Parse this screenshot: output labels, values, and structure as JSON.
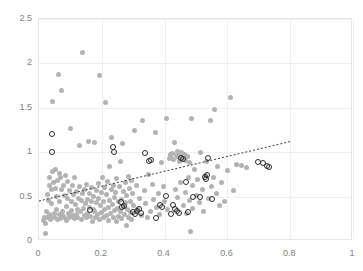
{
  "chart_data": {
    "type": "scatter",
    "title": "",
    "subtitle": "",
    "xlabel": "",
    "ylabel": "",
    "xlim": [
      0,
      1
    ],
    "ylim": [
      0,
      2.5
    ],
    "xticks": [
      "0",
      "0.2",
      "0.4",
      "0.6",
      "0.8",
      "1"
    ],
    "xtick_values": [
      0,
      0.2,
      0.4,
      0.6,
      0.8,
      1
    ],
    "yticks": [
      "0",
      "0.5",
      "1",
      "1.5",
      "2",
      "2.5"
    ],
    "ytick_values": [
      0,
      0.5,
      1,
      1.5,
      2,
      2.5
    ],
    "grid": true,
    "grid_color": "#f0f0f0",
    "legend": null,
    "legend_position": "none",
    "annotations": [],
    "series": [
      {
        "name": "gray-filled-points",
        "marker": "filled-circle",
        "color": "#b3b3b3",
        "points": [
          [
            0.015,
            0.23
          ],
          [
            0.018,
            0.27
          ],
          [
            0.02,
            0.2
          ],
          [
            0.022,
            0.08
          ],
          [
            0.024,
            0.33
          ],
          [
            0.026,
            0.26
          ],
          [
            0.028,
            0.52
          ],
          [
            0.03,
            0.46
          ],
          [
            0.032,
            0.62
          ],
          [
            0.034,
            0.3
          ],
          [
            0.035,
            0.71
          ],
          [
            0.036,
            0.28
          ],
          [
            0.038,
            0.24
          ],
          [
            0.04,
            0.58
          ],
          [
            0.041,
            0.42
          ],
          [
            0.043,
            0.78
          ],
          [
            0.044,
            1.57
          ],
          [
            0.046,
            0.66
          ],
          [
            0.048,
            0.31
          ],
          [
            0.05,
            0.27
          ],
          [
            0.052,
            0.8
          ],
          [
            0.054,
            0.59
          ],
          [
            0.055,
            0.5
          ],
          [
            0.057,
            0.36
          ],
          [
            0.058,
            0.24
          ],
          [
            0.06,
            0.68
          ],
          [
            0.062,
            1.88
          ],
          [
            0.064,
            0.76
          ],
          [
            0.065,
            0.44
          ],
          [
            0.066,
            0.3
          ],
          [
            0.068,
            0.25
          ],
          [
            0.07,
            0.72
          ],
          [
            0.072,
            0.58
          ],
          [
            0.073,
            1.7
          ],
          [
            0.075,
            0.33
          ],
          [
            0.076,
            0.29
          ],
          [
            0.078,
            0.62
          ],
          [
            0.08,
            0.51
          ],
          [
            0.082,
            0.27
          ],
          [
            0.084,
            0.74
          ],
          [
            0.086,
            0.39
          ],
          [
            0.088,
            0.23
          ],
          [
            0.09,
            0.67
          ],
          [
            0.092,
            0.48
          ],
          [
            0.094,
            0.31
          ],
          [
            0.096,
            0.26
          ],
          [
            0.098,
            0.57
          ],
          [
            0.1,
            1.27
          ],
          [
            0.102,
            0.44
          ],
          [
            0.104,
            0.34
          ],
          [
            0.106,
            0.29
          ],
          [
            0.108,
            0.63
          ],
          [
            0.11,
            0.52
          ],
          [
            0.112,
            0.25
          ],
          [
            0.114,
            0.71
          ],
          [
            0.116,
            0.41
          ],
          [
            0.118,
            0.3
          ],
          [
            0.12,
            0.56
          ],
          [
            0.122,
            0.35
          ],
          [
            0.124,
            0.27
          ],
          [
            0.126,
            0.48
          ],
          [
            0.128,
            1.08
          ],
          [
            0.13,
            0.61
          ],
          [
            0.132,
            0.33
          ],
          [
            0.134,
            0.24
          ],
          [
            0.136,
            0.46
          ],
          [
            0.138,
            0.53
          ],
          [
            0.14,
            2.12
          ],
          [
            0.142,
            0.37
          ],
          [
            0.144,
            0.29
          ],
          [
            0.146,
            0.58
          ],
          [
            0.148,
            0.42
          ],
          [
            0.15,
            0.26
          ],
          [
            0.152,
            0.64
          ],
          [
            0.154,
            0.47
          ],
          [
            0.156,
            0.31
          ],
          [
            0.158,
            1.12
          ],
          [
            0.16,
            0.38
          ],
          [
            0.162,
            0.54
          ],
          [
            0.164,
            0.28
          ],
          [
            0.166,
            0.45
          ],
          [
            0.168,
            0.6
          ],
          [
            0.17,
            0.22
          ],
          [
            0.172,
            0.36
          ],
          [
            0.174,
            0.5
          ],
          [
            0.176,
            1.11
          ],
          [
            0.178,
            0.33
          ],
          [
            0.18,
            0.27
          ],
          [
            0.182,
            0.57
          ],
          [
            0.184,
            0.43
          ],
          [
            0.186,
            0.3
          ],
          [
            0.188,
            0.65
          ],
          [
            0.19,
            0.48
          ],
          [
            0.192,
            0.24
          ],
          [
            0.194,
            1.86
          ],
          [
            0.196,
            0.4
          ],
          [
            0.198,
            0.55
          ],
          [
            0.2,
            0.32
          ],
          [
            0.202,
            0.71
          ],
          [
            0.204,
            0.26
          ],
          [
            0.206,
            0.44
          ],
          [
            0.208,
            0.6
          ],
          [
            0.21,
            0.35
          ],
          [
            0.212,
            1.56
          ],
          [
            0.214,
            0.29
          ],
          [
            0.216,
            0.52
          ],
          [
            0.218,
            0.67
          ],
          [
            0.22,
            0.38
          ],
          [
            0.222,
            0.23
          ],
          [
            0.224,
            0.46
          ],
          [
            0.226,
            0.84
          ],
          [
            0.228,
            0.31
          ],
          [
            0.23,
            0.58
          ],
          [
            0.232,
            1.17
          ],
          [
            0.234,
            0.41
          ],
          [
            0.236,
            0.27
          ],
          [
            0.238,
            0.63
          ],
          [
            0.24,
            0.49
          ],
          [
            0.242,
            0.34
          ],
          [
            0.244,
            0.55
          ],
          [
            0.246,
            0.22
          ],
          [
            0.248,
            0.7
          ],
          [
            0.25,
            0.37
          ],
          [
            0.252,
            0.44
          ],
          [
            0.254,
            0.28
          ],
          [
            0.256,
            0.61
          ],
          [
            0.258,
            0.89
          ],
          [
            0.26,
            0.33
          ],
          [
            0.262,
            0.47
          ],
          [
            0.264,
            0.25
          ],
          [
            0.266,
            1.1
          ],
          [
            0.268,
            0.56
          ],
          [
            0.27,
            0.39
          ],
          [
            0.272,
            0.3
          ],
          [
            0.274,
            0.66
          ],
          [
            0.276,
            0.43
          ],
          [
            0.278,
            0.18
          ],
          [
            0.28,
            0.51
          ],
          [
            0.282,
            0.36
          ],
          [
            0.284,
            0.73
          ],
          [
            0.286,
            0.27
          ],
          [
            0.288,
            0.59
          ],
          [
            0.29,
            0.45
          ],
          [
            0.292,
            0.32
          ],
          [
            0.294,
            0.68
          ],
          [
            0.296,
            0.24
          ],
          [
            0.298,
            0.53
          ],
          [
            0.3,
            0.4
          ],
          [
            0.305,
            1.25
          ],
          [
            0.31,
            0.62
          ],
          [
            0.315,
            0.35
          ],
          [
            0.32,
            0.48
          ],
          [
            0.325,
            0.29
          ],
          [
            0.33,
            1.36
          ],
          [
            0.335,
            0.57
          ],
          [
            0.34,
            0.42
          ],
          [
            0.345,
            0.26
          ],
          [
            0.35,
            0.75
          ],
          [
            0.355,
            0.33
          ],
          [
            0.36,
            0.64
          ],
          [
            0.365,
            0.47
          ],
          [
            0.37,
            1.22
          ],
          [
            0.375,
            0.38
          ],
          [
            0.38,
            0.54
          ],
          [
            0.385,
            0.3
          ],
          [
            0.39,
            0.88
          ],
          [
            0.395,
            0.61
          ],
          [
            0.4,
            0.44
          ],
          [
            0.405,
            1.38
          ],
          [
            0.41,
            0.35
          ],
          [
            0.415,
            0.93
          ],
          [
            0.418,
            0.97
          ],
          [
            0.42,
            0.95
          ],
          [
            0.424,
            0.99
          ],
          [
            0.428,
            0.92
          ],
          [
            0.432,
            1.11
          ],
          [
            0.435,
            0.58
          ],
          [
            0.438,
            0.96
          ],
          [
            0.44,
            0.49
          ],
          [
            0.442,
            1.01
          ],
          [
            0.445,
            0.94
          ],
          [
            0.448,
            0.9
          ],
          [
            0.45,
            0.66
          ],
          [
            0.452,
            0.98
          ],
          [
            0.455,
            1.0
          ],
          [
            0.458,
            0.93
          ],
          [
            0.46,
            0.4
          ],
          [
            0.462,
            0.97
          ],
          [
            0.465,
            0.55
          ],
          [
            0.468,
            0.91
          ],
          [
            0.47,
            0.31
          ],
          [
            0.472,
            0.95
          ],
          [
            0.475,
            0.72
          ],
          [
            0.478,
            0.88
          ],
          [
            0.48,
            0.46
          ],
          [
            0.482,
            0.11
          ],
          [
            0.485,
            1.38
          ],
          [
            0.488,
            0.62
          ],
          [
            0.49,
            0.37
          ],
          [
            0.495,
            0.8
          ],
          [
            0.5,
            0.51
          ],
          [
            0.505,
            0.69
          ],
          [
            0.51,
            0.43
          ],
          [
            0.515,
            1.0
          ],
          [
            0.52,
            0.58
          ],
          [
            0.525,
            0.33
          ],
          [
            0.53,
            0.74
          ],
          [
            0.535,
            0.9
          ],
          [
            0.54,
            0.48
          ],
          [
            0.545,
            1.36
          ],
          [
            0.55,
            0.61
          ],
          [
            0.555,
            0.71
          ],
          [
            0.56,
            1.48
          ],
          [
            0.565,
            0.53
          ],
          [
            0.57,
            0.84
          ],
          [
            0.575,
            0.4
          ],
          [
            0.58,
            0.66
          ],
          [
            0.59,
            0.45
          ],
          [
            0.6,
            0.79
          ],
          [
            0.61,
            1.62
          ],
          [
            0.62,
            0.57
          ],
          [
            0.63,
            0.86
          ],
          [
            0.645,
            0.85
          ],
          [
            0.66,
            0.83
          ]
        ]
      },
      {
        "name": "black-open-points",
        "marker": "open-circle",
        "color": "#2b2b2b",
        "points": [
          [
            0.04,
            1.21
          ],
          [
            0.04,
            1.0
          ],
          [
            0.162,
            0.35
          ],
          [
            0.236,
            1.06
          ],
          [
            0.24,
            1.0
          ],
          [
            0.262,
            0.44
          ],
          [
            0.265,
            0.38
          ],
          [
            0.272,
            0.39
          ],
          [
            0.3,
            0.33
          ],
          [
            0.305,
            0.3
          ],
          [
            0.312,
            0.34
          ],
          [
            0.32,
            0.36
          ],
          [
            0.326,
            0.32
          ],
          [
            0.338,
            0.99
          ],
          [
            0.35,
            0.9
          ],
          [
            0.356,
            0.91
          ],
          [
            0.372,
            0.26
          ],
          [
            0.386,
            0.41
          ],
          [
            0.392,
            0.38
          ],
          [
            0.405,
            0.51
          ],
          [
            0.42,
            0.3
          ],
          [
            0.428,
            0.4
          ],
          [
            0.432,
            0.36
          ],
          [
            0.44,
            0.34
          ],
          [
            0.446,
            0.32
          ],
          [
            0.452,
            0.93
          ],
          [
            0.46,
            0.92
          ],
          [
            0.468,
            0.66
          ],
          [
            0.474,
            0.33
          ],
          [
            0.492,
            0.5
          ],
          [
            0.512,
            0.49
          ],
          [
            0.528,
            0.72
          ],
          [
            0.532,
            0.7
          ],
          [
            0.536,
            0.74
          ],
          [
            0.538,
            0.94
          ],
          [
            0.552,
            0.47
          ],
          [
            0.698,
            0.89
          ],
          [
            0.712,
            0.88
          ],
          [
            0.726,
            0.85
          ],
          [
            0.732,
            0.83
          ]
        ]
      }
    ],
    "trendline": {
      "style": "dotted",
      "color": "#3a3a3a",
      "x_start": 0.0,
      "y_start": 0.45,
      "x_end": 0.8,
      "y_end": 1.12
    }
  }
}
